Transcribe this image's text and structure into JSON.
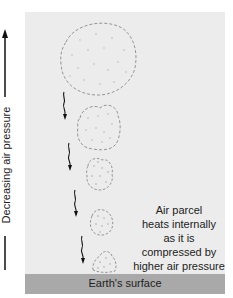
{
  "diagram": {
    "type": "adiabatic-compression-illustration",
    "axis": {
      "label": "Decreasing air pressure",
      "direction": "up"
    },
    "caption_lines": [
      "Air parcel",
      "heats internally",
      "as it is",
      "compressed by",
      "higher air pressure"
    ],
    "ground_label": "Earth's surface",
    "parcels": [
      {
        "name": "parcel-1",
        "cx": 98,
        "cy": 58,
        "rx": 37,
        "ry": 37
      },
      {
        "name": "parcel-2",
        "cx": 98,
        "cy": 127,
        "rx": 21,
        "ry": 23
      },
      {
        "name": "parcel-3",
        "cx": 99,
        "cy": 174,
        "rx": 13,
        "ry": 16
      },
      {
        "name": "parcel-4",
        "cx": 101,
        "cy": 222,
        "rx": 11,
        "ry": 14
      },
      {
        "name": "parcel-5",
        "cx": 104,
        "cy": 261,
        "rx": 12,
        "ry": 11
      }
    ],
    "arrows_count": 4,
    "colors": {
      "background": "#ececec",
      "ground": "#a9a9a9",
      "parcel_outline": "#8a8a8a",
      "text": "#222222"
    }
  }
}
